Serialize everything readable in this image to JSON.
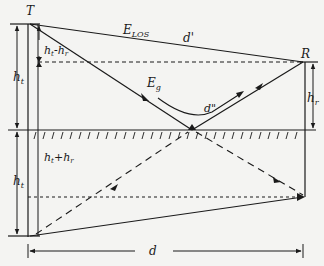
{
  "diagram": {
    "labels": {
      "transmitter": "T",
      "receiver": "R",
      "los_field": "E",
      "los_field_sub": "LOS",
      "ground_field": "E",
      "ground_field_sub": "g",
      "los_distance": "d'",
      "reflected_distance": "d\"",
      "tx_height_upper": "h",
      "tx_height_upper_sub": "t",
      "tx_height_lower": "h",
      "tx_height_lower_sub": "t",
      "rx_height": "h",
      "rx_height_sub": "r",
      "diff_h": "h",
      "diff_h_sub1": "t",
      "diff_h_mid": "-h",
      "diff_h_sub2": "r",
      "sum_h": "h",
      "sum_h_sub1": "t",
      "sum_h_mid": "+h",
      "sum_h_sub2": "r",
      "distance": "d"
    },
    "colors": {
      "line": "#1a1a1a",
      "background": "#f4f4f2"
    }
  }
}
